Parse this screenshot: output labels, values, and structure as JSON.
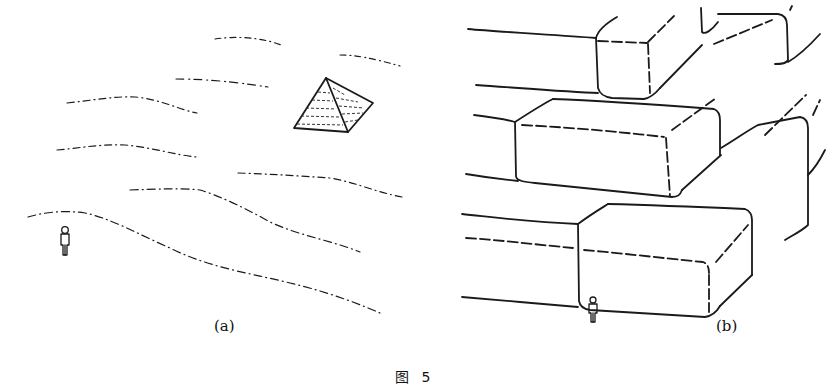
{
  "figure": {
    "panels": [
      {
        "id": "a",
        "label": "(a)",
        "description": "Small pyramid in a desert landscape with a human figure for scale"
      },
      {
        "id": "b",
        "label": "(b)",
        "description": "Close-up of large stone blocks of a pyramid with a tiny human figure for scale"
      }
    ],
    "caption": "图 5"
  },
  "colors": {
    "ink": "#1a1a1a",
    "background": "#ffffff"
  }
}
